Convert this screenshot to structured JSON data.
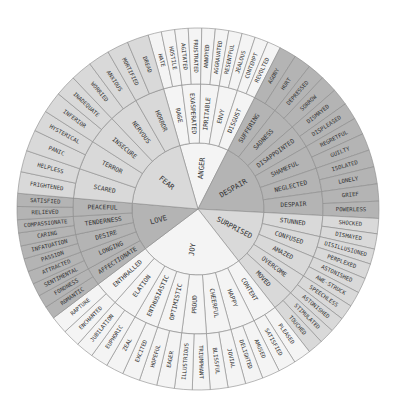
{
  "wheel": {
    "center": [
      198,
      209
    ],
    "radii": {
      "inner": 66,
      "middle": 125,
      "outer": 181
    },
    "colors": {
      "light": "#f4f4f4",
      "mid": "#d9d9d9",
      "dark": "#b4b4b4"
    },
    "emotions": [
      {
        "label": "ANGER",
        "start": -16,
        "end": 27,
        "shade": "light",
        "children": [
          {
            "label": "RAGE",
            "children": [
              "HATE",
              "HOSTILE"
            ]
          },
          {
            "label": "EXASPERATED",
            "children": [
              "AGITATED",
              "FRUSTRATED"
            ]
          },
          {
            "label": "IRRITABLE",
            "children": [
              "ANNOYED",
              "AGGRAVATED"
            ]
          },
          {
            "label": "ENVY",
            "children": [
              "RESENTFUL",
              "JEALOUS"
            ]
          },
          {
            "label": "DISGUST",
            "children": [
              "CONTEMPT",
              "REVOLTED"
            ]
          }
        ]
      },
      {
        "label": "DESPAIR",
        "start": 27,
        "end": 93,
        "shade": "dark",
        "children": [
          {
            "label": "SUFFERING",
            "children": [
              "AGONY",
              "HURT"
            ]
          },
          {
            "label": "SADNESS",
            "children": [
              "DEPRESSED",
              "SORROW"
            ]
          },
          {
            "label": "DISAPPOINTED",
            "children": [
              "DISMAYED",
              "DISPLEASED"
            ]
          },
          {
            "label": "SHAMEFUL",
            "children": [
              "REGRETFUL",
              "GUILTY"
            ]
          },
          {
            "label": "NEGLECTED",
            "children": [
              "ISOLATED",
              "LONELY"
            ]
          },
          {
            "label": "DESPAIR",
            "children": [
              "GRIEF",
              "POWERLESS"
            ]
          }
        ]
      },
      {
        "label": "SURPRISED",
        "start": 93,
        "end": 142,
        "shade": "mid",
        "children": [
          {
            "label": "STUNNED",
            "children": [
              "SHOCKED",
              "DISMAYED"
            ]
          },
          {
            "label": "CONFUSED",
            "children": [
              "DISILLUSIONED",
              "PERPLEXED"
            ]
          },
          {
            "label": "AMAZED",
            "children": [
              "ASTONISHED",
              "AWE-STRUCK"
            ]
          },
          {
            "label": "OVERCOME",
            "children": [
              "SPEECHLESS",
              "ASTONISHED"
            ]
          },
          {
            "label": "MOVED",
            "children": [
              "STIMULATED",
              "TOUCHED"
            ]
          }
        ]
      },
      {
        "label": "JOY",
        "start": 142,
        "end": 233,
        "shade": "light",
        "children": [
          {
            "label": "CONTENT",
            "children": [
              "PLEASED",
              "SATISFIED"
            ]
          },
          {
            "label": "HAPPY",
            "children": [
              "AMUSED",
              "DELIGHTED"
            ]
          },
          {
            "label": "CHEERFUL",
            "children": [
              "JOVIAL",
              "BLISSFUL"
            ]
          },
          {
            "label": "PROUD",
            "children": [
              "TRIUMPHANT",
              "ILLUSTRIOUS"
            ]
          },
          {
            "label": "OPTIMISTIC",
            "children": [
              "EAGER",
              "HOPEFUL"
            ]
          },
          {
            "label": "ENTHUSIASTIC",
            "children": [
              "EXCITED",
              "ZEAL"
            ]
          },
          {
            "label": "ELATION",
            "children": [
              "EUPHORIC",
              "JUBILATION"
            ]
          },
          {
            "label": "ENTHRALLED",
            "children": [
              "ENCHANTED",
              "RAPTURE"
            ]
          }
        ]
      },
      {
        "label": "LOVE",
        "start": 233,
        "end": 275,
        "shade": "dark",
        "children": [
          {
            "label": "AFFECTIONATE",
            "children": [
              "ROMANTIC",
              "FONDNESS"
            ]
          },
          {
            "label": "LONGING",
            "children": [
              "SENTIMENTAL",
              "ATTRACTED"
            ]
          },
          {
            "label": "DESIRE",
            "children": [
              "PASSION",
              "INFATUATION"
            ]
          },
          {
            "label": "TENDERNESS",
            "children": [
              "CARING",
              "COMPASSIONATE"
            ]
          },
          {
            "label": "PEACEFUL",
            "children": [
              "RELIEVED",
              "SATISFIED"
            ]
          }
        ]
      },
      {
        "label": "FEAR",
        "start": 275,
        "end": 344,
        "shade": "mid",
        "children": [
          {
            "label": "SCARED",
            "children": [
              "FRIGHTENED",
              "HELPLESS"
            ]
          },
          {
            "label": "TERROR",
            "children": [
              "PANIC",
              "HYSTERICAL"
            ]
          },
          {
            "label": "INSECURE",
            "children": [
              "INFERIOR",
              "INADEQUATE"
            ]
          },
          {
            "label": "NERVOUS",
            "children": [
              "WORRIED",
              "ANXIOUS"
            ]
          },
          {
            "label": "HORROR",
            "children": [
              "MORTIFIED",
              "DREAD"
            ]
          }
        ]
      }
    ]
  }
}
